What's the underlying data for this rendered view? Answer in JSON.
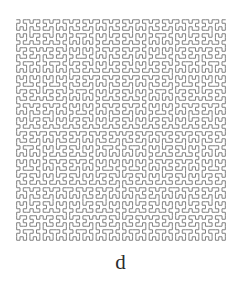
{
  "figure": {
    "caption_label": "d",
    "title": "",
    "background_color": "#ffffff"
  },
  "chart_data": {
    "type": "line",
    "name": "hilbert-curve",
    "title": "",
    "subtitle": "",
    "xlabel": "",
    "ylabel": "",
    "panel_label": "d",
    "curve": {
      "family": "hilbert",
      "order": 6,
      "grid_cells_per_side": 64,
      "total_points": 4096,
      "segment_count": 4095,
      "closed": false
    },
    "style": {
      "stroke_color": "#808080",
      "stroke_width": 1.0,
      "stroke_linecap": "round",
      "stroke_linejoin": "round",
      "fill": "none",
      "background": "#ffffff"
    },
    "plot_box_px": {
      "x_min": 15,
      "y_min": 18,
      "x_max": 227,
      "y_max": 242,
      "width": 212,
      "height": 224
    },
    "axes": {
      "visible": false,
      "grid": false,
      "x_ticks": [],
      "y_ticks": [],
      "xlim": [
        0,
        63
      ],
      "ylim": [
        0,
        63
      ]
    },
    "legend": {
      "visible": false,
      "position": "none",
      "entries": []
    },
    "annotations": [
      {
        "text": "d",
        "role": "subfigure-label",
        "x_px": 118,
        "y_px": 261
      }
    ]
  }
}
